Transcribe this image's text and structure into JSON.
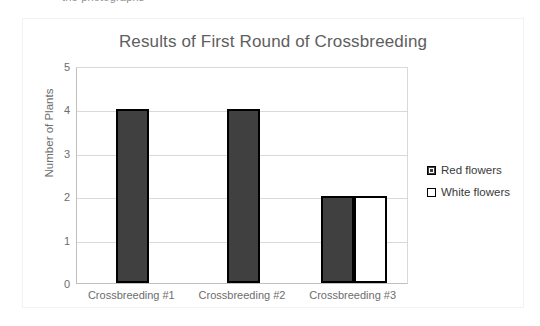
{
  "page": {
    "cut_off_top_text": "the photographs",
    "background_color": "#ffffff"
  },
  "chart": {
    "title": "Results of First Round of Crossbreeding",
    "title_color": "#5e5e5e",
    "frame_border_color": "#f2f2f2",
    "gridline_color": "#d9d9d9",
    "axis_color": "#bfbfbf"
  },
  "axes": {
    "y_title": "Number of Plants",
    "y_ticks": [
      "0",
      "1",
      "2",
      "3",
      "4",
      "5"
    ],
    "x_categories": [
      "Crossbreeding #1",
      "Crossbreeding #2",
      "Crossbreeding #3"
    ]
  },
  "legend": {
    "items": [
      {
        "label": "Red flowers",
        "swatch": "red",
        "color": "#404040"
      },
      {
        "label": "White flowers",
        "swatch": "white",
        "color": "#ffffff"
      }
    ]
  },
  "chart_data": {
    "type": "bar",
    "title": "Results of First Round of Crossbreeding",
    "xlabel": "",
    "ylabel": "Number of Plants",
    "ylim": [
      0,
      5
    ],
    "yticks": [
      0,
      1,
      2,
      3,
      4,
      5
    ],
    "grid": true,
    "legend_position": "right",
    "categories": [
      "Crossbreeding #1",
      "Crossbreeding #2",
      "Crossbreeding #3"
    ],
    "series": [
      {
        "name": "Red flowers",
        "color": "#404040",
        "values": [
          4,
          4,
          2
        ]
      },
      {
        "name": "White flowers",
        "color": "#ffffff",
        "values": [
          0,
          0,
          2
        ]
      }
    ]
  }
}
